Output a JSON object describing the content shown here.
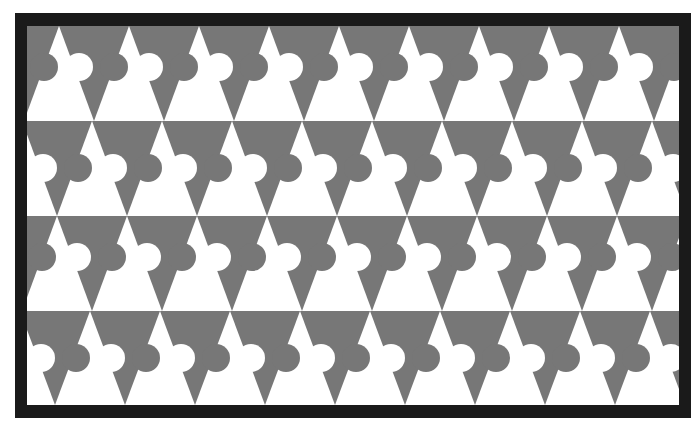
{
  "artwork": {
    "subject": "tessellation of triangles with interlocking circular lobes",
    "frame": {
      "color": "#1a1a1a",
      "outer": {
        "x": 15,
        "y": 13,
        "width": 676,
        "height": 405
      }
    },
    "canvas": {
      "x": 27,
      "y": 26,
      "width": 652,
      "height": 379
    },
    "colors": {
      "gray": "#777777",
      "white": "#ffffff"
    },
    "period": 70,
    "lobe_radius": 14,
    "rows": [
      {
        "top": 0,
        "height": 95,
        "background": "gray",
        "triangle": "white",
        "direction": "up",
        "apex_phase": 32,
        "notch_dx": -15,
        "lobe_dx": 20,
        "lobe_dy": 41
      },
      {
        "top": 95,
        "height": 95,
        "background": "white",
        "triangle": "gray",
        "direction": "down",
        "apex_phase": 30,
        "notch_dx": -14,
        "lobe_dx": 21,
        "lobe_dy": 47
      },
      {
        "top": 190,
        "height": 95,
        "background": "gray",
        "triangle": "white",
        "direction": "up",
        "apex_phase": 30,
        "notch_dx": -15,
        "lobe_dx": 20,
        "lobe_dy": 41
      },
      {
        "top": 285,
        "height": 94,
        "background": "white",
        "triangle": "gray",
        "direction": "down",
        "apex_phase": 28,
        "notch_dx": -14,
        "lobe_dx": 21,
        "lobe_dy": 47
      }
    ]
  }
}
